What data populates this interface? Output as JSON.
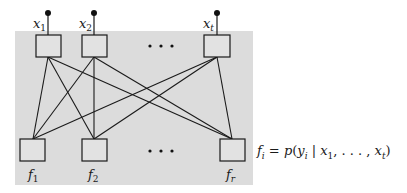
{
  "diagram": {
    "type": "bipartite-network",
    "background_panel_color": "#dcdcdc",
    "line_color": "#1a1a1a",
    "input_nodes": [
      {
        "id": "x1",
        "base": "x",
        "sub": "1",
        "cx": 48
      },
      {
        "id": "x2",
        "base": "x",
        "sub": "2",
        "cx": 94
      },
      {
        "id": "xt",
        "base": "x",
        "sub": "t",
        "cx": 217
      }
    ],
    "output_nodes": [
      {
        "id": "f1",
        "base": "f",
        "sub": "1",
        "cx": 33
      },
      {
        "id": "f2",
        "base": "f",
        "sub": "2",
        "cx": 94
      },
      {
        "id": "fr",
        "base": "f",
        "sub": "r",
        "cx": 232
      }
    ],
    "ellipsis_top": "• • •",
    "ellipsis_bottom": "• • •",
    "edges": [
      [
        "x1",
        "f1"
      ],
      [
        "x1",
        "f2"
      ],
      [
        "x1",
        "fr"
      ],
      [
        "x2",
        "f1"
      ],
      [
        "x2",
        "f2"
      ],
      [
        "x2",
        "fr"
      ],
      [
        "xt",
        "f1"
      ],
      [
        "xt",
        "f2"
      ],
      [
        "xt",
        "fr"
      ]
    ]
  },
  "formula": {
    "lhs_base": "f",
    "lhs_sub": "i",
    "eq": " = ",
    "p": "p",
    "open": "(",
    "y_base": "y",
    "y_sub": "i",
    "bar": " | ",
    "x1_base": "x",
    "x1_sub": "1",
    "dots": ", . . . , ",
    "xt_base": "x",
    "xt_sub": "t",
    "close": ")"
  }
}
